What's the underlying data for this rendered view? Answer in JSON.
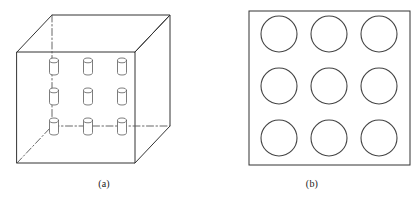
{
  "figure": {
    "background_color": "#ffffff",
    "line_color": "#333333",
    "hidden_line_color": "#555555",
    "caption_color": "#1a1a1a"
  },
  "panels": [
    {
      "id": "a",
      "caption": "(a)",
      "type": "3d-box-with-cylinder-array",
      "description": "Rectangular enclosure drawn in parallel projection containing a 3 by 3 array of small cylinders on the front face",
      "box": {
        "front_face": {
          "x": 17,
          "y": 52,
          "width": 118,
          "height": 111
        },
        "depth_offset": {
          "dx": 35,
          "dy": -37
        },
        "visible_edges": 9,
        "hidden_edges": 3,
        "hidden_edge_style": "dash-dot"
      },
      "cylinder_array": {
        "rows": 3,
        "columns": 3,
        "count": 9,
        "cylinder_width": 9,
        "cylinder_height": 17,
        "ellipse_ry": 2.4,
        "centers_x": [
          54,
          88,
          122
        ],
        "tops_y": [
          58,
          88,
          118
        ]
      }
    },
    {
      "id": "b",
      "caption": "(b)",
      "type": "square-with-circle-array",
      "description": "Square plan view containing a 3 by 3 array of circles",
      "square": {
        "x": 41,
        "y": 11,
        "width": 161,
        "height": 154
      },
      "circle_array": {
        "rows": 3,
        "columns": 3,
        "count": 9,
        "radius": 18,
        "centers_x": [
          71,
          121,
          171
        ],
        "centers_y": [
          34,
          86,
          138
        ]
      }
    }
  ]
}
